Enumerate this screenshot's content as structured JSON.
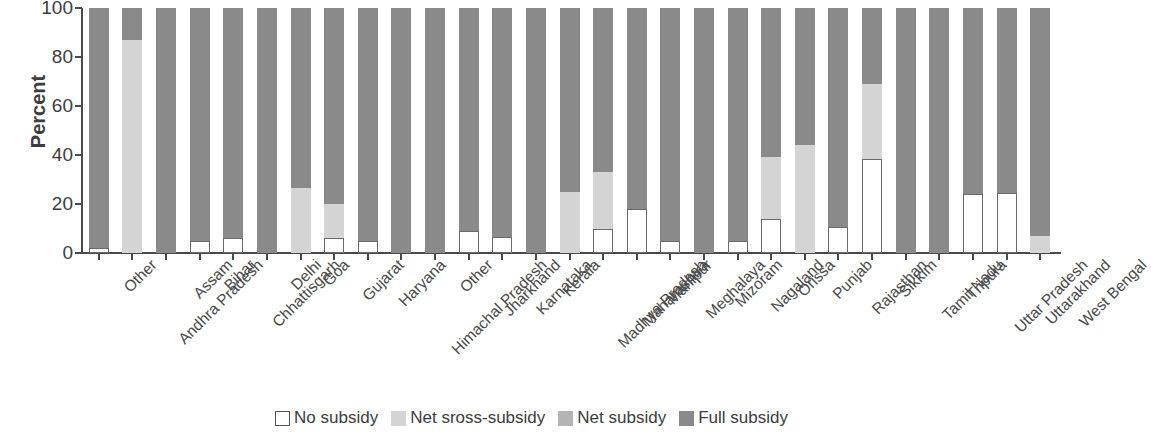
{
  "chart_data": {
    "type": "bar",
    "subtype": "stacked-bar-100",
    "title": "",
    "xlabel": "",
    "ylabel": "Percent",
    "ylim": [
      0,
      100
    ],
    "yticks": [
      0,
      20,
      40,
      60,
      80,
      100
    ],
    "grid": false,
    "legend_position": "bottom-center",
    "categories": [
      "Other",
      "Andhra Pradesh",
      "Assam",
      "Bihar",
      "Chhattisgarh",
      "Delhi",
      "Goa",
      "Gujarat",
      "Haryana",
      "Himachal Pradesh",
      "Other",
      "Jharkhand",
      "Karnataka",
      "Kerala",
      "Madhya Pradesh",
      "Maharashtra",
      "Manipur",
      "Meghalaya",
      "Mizoram",
      "Nagaland",
      "Orissa",
      "Punjab",
      "Rajasthan",
      "Sikkim",
      "Tamil Nadu",
      "Tripura",
      "Uttar Pradesh",
      "Uttarakhand",
      "West Bengal"
    ],
    "series": [
      {
        "name": "No subsidy",
        "color": "#ffffff",
        "values": [
          2,
          0,
          0,
          5,
          6,
          0,
          0,
          6,
          5,
          0,
          0,
          9,
          6.5,
          0,
          0,
          10,
          18,
          5,
          0,
          5,
          14,
          0,
          10.5,
          38.5,
          0,
          0,
          24,
          24.5,
          0
        ]
      },
      {
        "name": "Net sross-subsidy",
        "color": "#d4d4d4",
        "values": [
          0,
          87,
          0,
          0,
          0,
          0,
          26.5,
          14,
          0,
          0,
          0,
          0,
          0,
          0,
          25,
          23,
          0,
          0,
          0,
          0,
          25,
          44,
          0,
          30.5,
          0,
          0,
          0,
          0,
          7
        ]
      },
      {
        "name": "Net subsidy",
        "color": "#b4b4b4",
        "values": [
          0,
          0,
          0,
          0,
          0,
          0,
          0,
          0,
          0,
          0,
          0,
          0,
          0,
          0,
          0,
          0,
          0,
          0,
          0,
          0,
          0,
          0,
          0,
          0,
          0,
          0,
          0,
          0,
          0
        ]
      },
      {
        "name": "Full subsidy",
        "color": "#8a8a8a",
        "values": [
          98,
          13,
          100,
          95,
          94,
          100,
          73.5,
          80,
          95,
          100,
          100,
          91,
          93.5,
          100,
          75,
          67,
          82,
          95,
          100,
          95,
          61,
          56,
          89.5,
          31,
          100,
          100,
          76,
          75.5,
          93
        ]
      }
    ]
  },
  "axis": {
    "y_title": "Percent",
    "y_tick_labels": [
      "0",
      "20",
      "40",
      "60",
      "80",
      "100"
    ]
  },
  "legend": {
    "items": [
      {
        "label": "No subsidy",
        "swatch": "sw-no"
      },
      {
        "label": "Net sross-subsidy",
        "swatch": "sw-cross"
      },
      {
        "label": "Net subsidy",
        "swatch": "sw-net"
      },
      {
        "label": "Full subsidy",
        "swatch": "sw-full"
      }
    ]
  },
  "colors": {
    "no_subsidy": "#ffffff",
    "net_cross_subsidy": "#d4d4d4",
    "net_subsidy": "#b4b4b4",
    "full_subsidy": "#8a8a8a",
    "axis": "#4a4a4a",
    "text": "#3d3d3d"
  }
}
